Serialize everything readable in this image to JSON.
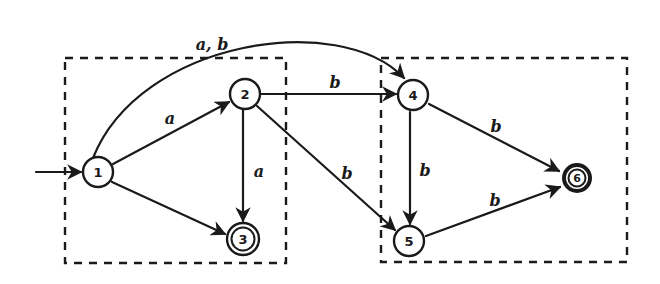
{
  "diagram": {
    "type": "finite-automaton",
    "groups": [
      {
        "id": "left-group",
        "contains": [
          "1",
          "2",
          "3"
        ]
      },
      {
        "id": "right-group",
        "contains": [
          "4",
          "5",
          "6"
        ]
      }
    ],
    "nodes": [
      {
        "id": "1",
        "label": "1",
        "start": true,
        "accepting": false
      },
      {
        "id": "2",
        "label": "2",
        "start": false,
        "accepting": false
      },
      {
        "id": "3",
        "label": "3",
        "start": false,
        "accepting": true
      },
      {
        "id": "4",
        "label": "4",
        "start": false,
        "accepting": false
      },
      {
        "id": "5",
        "label": "5",
        "start": false,
        "accepting": false
      },
      {
        "id": "6",
        "label": "6",
        "start": false,
        "accepting": true
      }
    ],
    "edges": [
      {
        "from": "1",
        "to": "2",
        "label": "a"
      },
      {
        "from": "1",
        "to": "3",
        "label": ""
      },
      {
        "from": "1",
        "to": "4",
        "label": "a, b"
      },
      {
        "from": "2",
        "to": "3",
        "label": "a"
      },
      {
        "from": "2",
        "to": "4",
        "label": "b"
      },
      {
        "from": "2",
        "to": "5",
        "label": "b"
      },
      {
        "from": "4",
        "to": "5",
        "label": "b"
      },
      {
        "from": "4",
        "to": "6",
        "label": "b"
      },
      {
        "from": "5",
        "to": "6",
        "label": "b"
      }
    ]
  }
}
